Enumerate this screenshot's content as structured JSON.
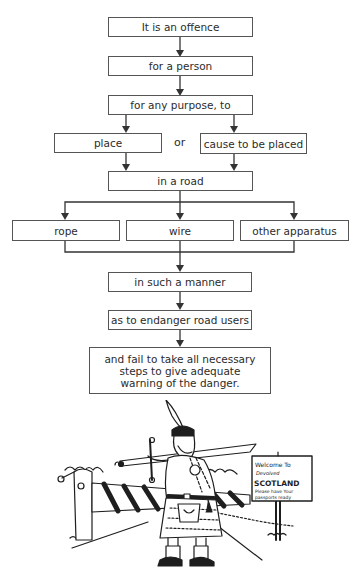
{
  "diagram": {
    "type": "flowchart",
    "nodes": {
      "n1": "It is an offence",
      "n2": "for a person",
      "n3": "for any purpose, to",
      "n4a": "place",
      "or": "or",
      "n4b": "cause to be placed",
      "n5": "in a road",
      "n6a": "rope",
      "n6b": "wire",
      "n6c": "other apparatus",
      "n7": "in such a manner",
      "n8": "as to endanger road users",
      "n9": "and fail to take all necessary steps to give adequate warning of the danger."
    },
    "edges": [
      [
        "n1",
        "n2"
      ],
      [
        "n2",
        "n3"
      ],
      [
        "n3",
        "n4a"
      ],
      [
        "n3",
        "n4b"
      ],
      [
        "n4a",
        "n5"
      ],
      [
        "n4b",
        "n5"
      ],
      [
        "n5",
        "n6a"
      ],
      [
        "n5",
        "n6b"
      ],
      [
        "n5",
        "n6c"
      ],
      [
        "n6a",
        "n7"
      ],
      [
        "n6b",
        "n7"
      ],
      [
        "n6c",
        "n7"
      ],
      [
        "n7",
        "n8"
      ],
      [
        "n8",
        "n9"
      ]
    ]
  },
  "illustration": {
    "description": "Cartoon of a kilted Highlander with a claymore sword on his shoulder standing in front of a striped road barrier, beside a sign",
    "sign": {
      "line1": "Welcome To",
      "line2": "Devolved",
      "line3": "SCOTLAND",
      "line4": "Please have Your",
      "line5": "passports ready"
    }
  }
}
